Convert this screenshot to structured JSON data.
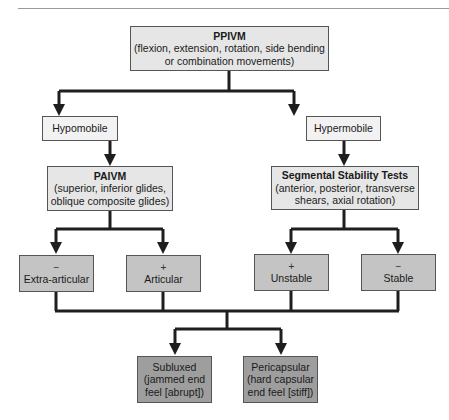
{
  "diagram": {
    "root": {
      "title": "PPIVM",
      "desc_line1": "(flexion, extension, rotation, side bending",
      "desc_line2": "or combination movements)"
    },
    "branches": {
      "left": {
        "label": "Hypomobile",
        "test": {
          "title": "PAIVM",
          "desc_line1": "(superior, inferior glides,",
          "desc_line2": "oblique composite glides)"
        },
        "outcomes": [
          {
            "sign": "−",
            "label": "Extra-articular"
          },
          {
            "sign": "+",
            "label": "Articular"
          }
        ]
      },
      "right": {
        "label": "Hypermobile",
        "test": {
          "title": "Segmental Stability Tests",
          "desc_line1": "(anterior, posterior, transverse",
          "desc_line2": "shears, axial rotation)"
        },
        "outcomes": [
          {
            "sign": "+",
            "label": "Unstable"
          },
          {
            "sign": "−",
            "label": "Stable"
          }
        ]
      }
    },
    "final": [
      {
        "line1": "Subluxed",
        "line2": "(jammed end",
        "line3": "feel [abrupt])"
      },
      {
        "line1": "Pericapsular",
        "line2": "(hard capsular",
        "line3": "end feel [stiff])"
      }
    ]
  },
  "colors": {
    "line": "#1e1e1e",
    "level1_fill": "#e6e6e6",
    "level2_fill": "#f2f2f2",
    "level3_fill": "#c4c4c4",
    "level4_fill": "#9e9e9e"
  }
}
